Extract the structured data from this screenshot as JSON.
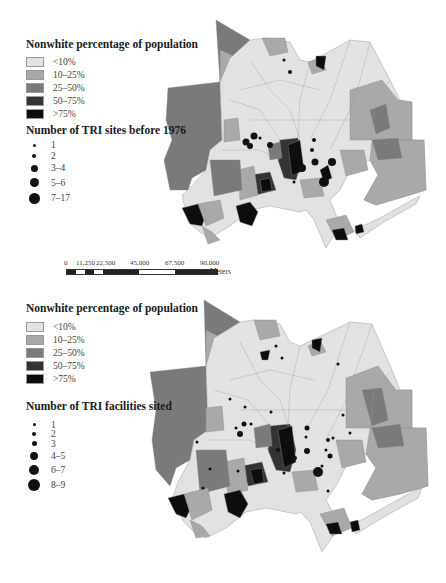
{
  "figure": {
    "panels": [
      {
        "id": "top",
        "choropleth_legend": {
          "title": "Nonwhite percentage of population",
          "classes": [
            {
              "label": "<10%",
              "color": "#e2e2e2"
            },
            {
              "label": "10–25%",
              "color": "#a9a9a9"
            },
            {
              "label": "25–50%",
              "color": "#7a7a7a"
            },
            {
              "label": "50–75%",
              "color": "#333333"
            },
            {
              "label": ">75%",
              "color": "#0d0d0d"
            }
          ]
        },
        "symbol_legend": {
          "title": "Number of TRI sites before 1976",
          "classes": [
            {
              "label": "1",
              "size": 3
            },
            {
              "label": "2",
              "size": 4
            },
            {
              "label": "3–4",
              "size": 7
            },
            {
              "label": "5–6",
              "size": 9
            },
            {
              "label": "7–17",
              "size": 11
            }
          ]
        },
        "scale_bar": {
          "ticks": [
            "0",
            "11,250",
            "22,500",
            "45,000",
            "67,500",
            "90,000"
          ],
          "unit": "Meters"
        }
      },
      {
        "id": "bottom",
        "choropleth_legend": {
          "title": "Nonwhite percentage of population",
          "classes": [
            {
              "label": "<10%",
              "color": "#e2e2e2"
            },
            {
              "label": "10–25%",
              "color": "#a9a9a9"
            },
            {
              "label": "25–50%",
              "color": "#7a7a7a"
            },
            {
              "label": "50–75%",
              "color": "#333333"
            },
            {
              "label": ">75%",
              "color": "#0d0d0d"
            }
          ]
        },
        "symbol_legend": {
          "title": "Number of TRI facilities sited",
          "classes": [
            {
              "label": "1",
              "size": 3
            },
            {
              "label": "2",
              "size": 4
            },
            {
              "label": "3",
              "size": 5
            },
            {
              "label": "4–5",
              "size": 8
            },
            {
              "label": "6–7",
              "size": 10
            },
            {
              "label": "8–9",
              "size": 12
            }
          ]
        }
      }
    ]
  }
}
